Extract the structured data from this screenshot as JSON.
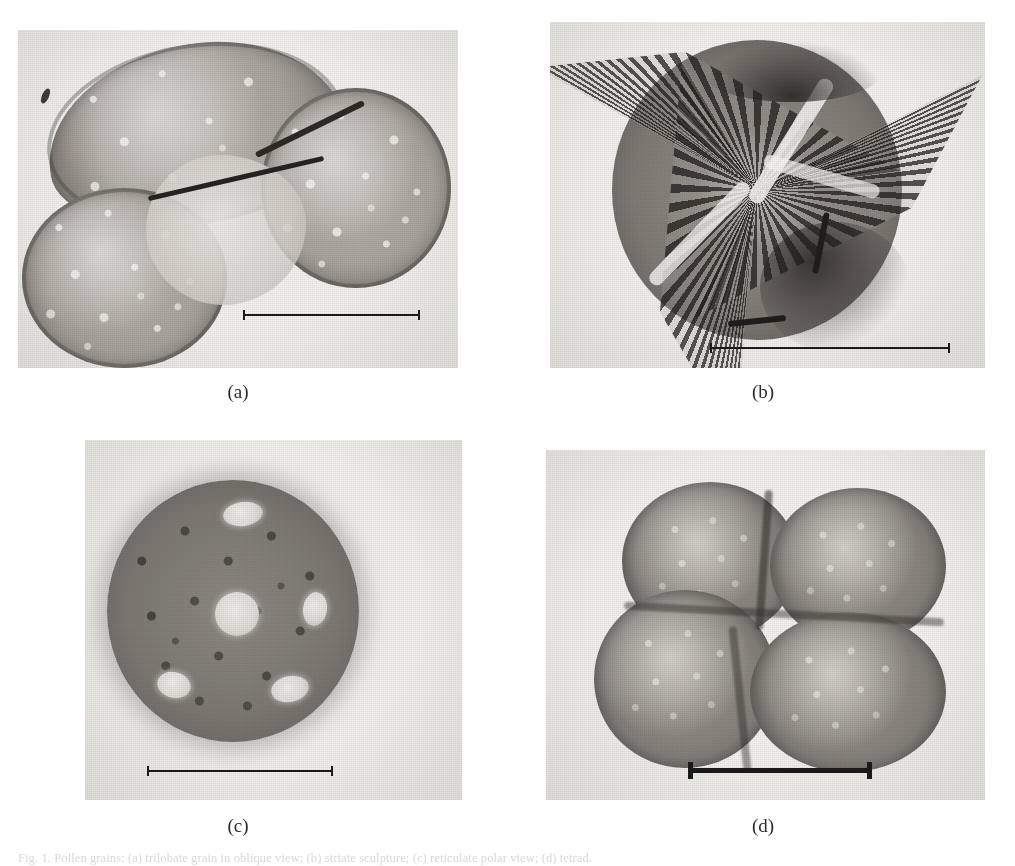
{
  "figure": {
    "kind": "photomicrograph-plate",
    "panel_count": 4,
    "caption_partial": "Fig. 1.  Pollen grains:  (a) trilobate grain in oblique view;  (b) striate sculpture;  (c) reticulate polar view;  (d) tetrad.",
    "background_color": "#ffffff",
    "ink_color": "#1a1a1a",
    "photo_tone": "#f2f1ee"
  },
  "panels": [
    {
      "id": "a",
      "label": "(a)",
      "subject": "trilobate pollen grain, oblique equatorial view",
      "texture": "coarsely reticulate exine with dark folded colpus",
      "scalebar": {
        "present": true,
        "weight": "thin"
      }
    },
    {
      "id": "b",
      "label": "(b)",
      "subject": "pollen grain with three radiating striate sectors",
      "texture": "striate / fibrous sculpture radiating from centre",
      "scalebar": {
        "present": true,
        "weight": "thin"
      }
    },
    {
      "id": "c",
      "label": "(c)",
      "subject": "spheroidal pollen grain, polar view",
      "texture": "reticulate exine with pale circular pores",
      "scalebar": {
        "present": true,
        "weight": "thin"
      }
    },
    {
      "id": "d",
      "label": "(d)",
      "subject": "pollen tetrad of four fused grains",
      "texture": "finely granular exine, four cells in tetrahedral arrangement",
      "scalebar": {
        "present": true,
        "weight": "bold"
      }
    }
  ]
}
